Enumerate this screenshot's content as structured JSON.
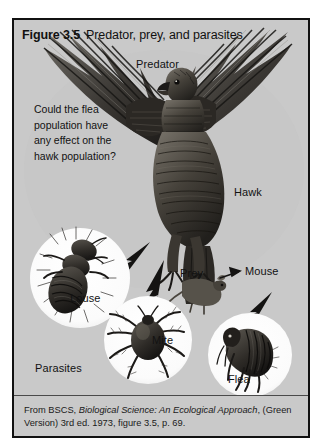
{
  "figure": {
    "number": "Figure 3.5",
    "title": "Predator, prey, and parasites"
  },
  "question": {
    "line1": "Could the flea",
    "line2": "population have",
    "line3": "any effect on the",
    "line4": "hawk population?"
  },
  "labels": {
    "predator": "Predator",
    "hawk": "Hawk",
    "prey": "Prey",
    "mouse": "Mouse",
    "louse": "Louse",
    "mite": "Mite",
    "flea": "Flea",
    "parasites": "Parasites"
  },
  "caption": {
    "prefix": "From BSCS, ",
    "book_title": "Biological Science: An Ecological Approach",
    "suffix": ", (Green Version) 3rd ed. 1973, figure 3.5, p. 69."
  },
  "colors": {
    "frame_border": "#111111",
    "panel_background": "#c9c9c9",
    "circle_fill": "#fbfbfb",
    "ink": "#121212",
    "page": "#ffffff"
  },
  "illustration": {
    "subject": "hawk-eagle-with-spread-wings",
    "inset_circles": [
      "louse-circle",
      "mite-circle",
      "flea-circle"
    ],
    "arrows": [
      "hawk-to-louse-arrow",
      "hawk-to-mite-arrow",
      "mouse-to-flea-arrow",
      "prey-to-mouse-arrow"
    ]
  }
}
